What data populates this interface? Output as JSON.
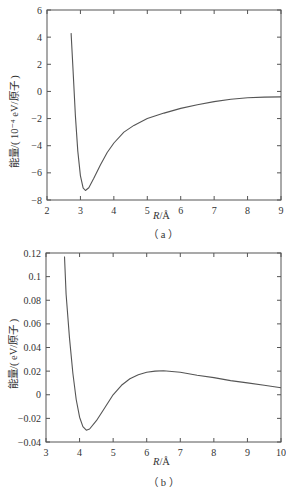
{
  "chart_data": [
    {
      "type": "line",
      "panel": "a",
      "caption": "（a）",
      "xlabel_var": "R",
      "xlabel_unit": "/Å",
      "ylabel": "能量/(10⁻⁴ eV/原子)",
      "xlim": [
        2,
        9
      ],
      "ylim": [
        -8,
        6
      ],
      "xticks": [
        2,
        3,
        4,
        5,
        6,
        7,
        8,
        9
      ],
      "yticks": [
        -8,
        -6,
        -4,
        -2,
        0,
        2,
        4,
        6
      ],
      "grid": false,
      "legend": null,
      "series": [
        {
          "name": "energy",
          "x": [
            2.72,
            2.78,
            2.85,
            2.92,
            3.0,
            3.08,
            3.15,
            3.25,
            3.4,
            3.6,
            3.8,
            4.0,
            4.3,
            4.6,
            5.0,
            5.5,
            6.0,
            6.5,
            7.0,
            7.5,
            8.0,
            8.5,
            9.0
          ],
          "y": [
            4.3,
            1.5,
            -1.8,
            -4.4,
            -6.2,
            -7.1,
            -7.3,
            -7.1,
            -6.4,
            -5.4,
            -4.5,
            -3.8,
            -3.0,
            -2.5,
            -2.0,
            -1.6,
            -1.25,
            -0.98,
            -0.75,
            -0.58,
            -0.47,
            -0.42,
            -0.4
          ]
        }
      ]
    },
    {
      "type": "line",
      "panel": "b",
      "caption": "（b）",
      "xlabel_var": "R",
      "xlabel_unit": "/Å",
      "ylabel": "能量/(eV/原子)",
      "xlim": [
        3,
        10
      ],
      "ylim": [
        -0.04,
        0.12
      ],
      "xticks": [
        3,
        4,
        5,
        6,
        7,
        8,
        9,
        10
      ],
      "yticks": [
        -0.04,
        -0.02,
        0,
        0.02,
        0.04,
        0.06,
        0.08,
        0.1,
        0.12
      ],
      "grid": false,
      "legend": null,
      "series": [
        {
          "name": "energy",
          "x": [
            3.55,
            3.6,
            3.7,
            3.8,
            3.9,
            4.0,
            4.1,
            4.2,
            4.3,
            4.5,
            4.75,
            5.0,
            5.25,
            5.5,
            5.75,
            6.0,
            6.25,
            6.5,
            7.0,
            7.5,
            8.0,
            8.5,
            9.0,
            9.5,
            10.0
          ],
          "y": [
            0.117,
            0.085,
            0.048,
            0.018,
            -0.004,
            -0.019,
            -0.027,
            -0.03,
            -0.029,
            -0.022,
            -0.011,
            0.0,
            0.008,
            0.0135,
            0.017,
            0.019,
            0.02,
            0.0203,
            0.019,
            0.0165,
            0.0145,
            0.012,
            0.01,
            0.008,
            0.006
          ]
        }
      ]
    }
  ],
  "figure": {
    "panels": [
      {
        "id": "a",
        "ylabel": "能量/( 10⁻⁴ eV/原子 )",
        "xlabel": "R/Å",
        "caption": "（a）",
        "xtick_labels": [
          "2",
          "3",
          "4",
          "5",
          "6",
          "7",
          "8",
          "9"
        ],
        "ytick_labels": [
          "6",
          "4",
          "2",
          "0",
          "-2",
          "-4",
          "-6",
          "-8"
        ]
      },
      {
        "id": "b",
        "ylabel": "能量/( eV/原子 )",
        "xlabel": "R/Å",
        "caption": "（b）",
        "xtick_labels": [
          "3",
          "4",
          "5",
          "6",
          "7",
          "8",
          "9",
          "10"
        ],
        "ytick_labels": [
          "0.12",
          "0.1",
          "0.08",
          "0.06",
          "0.04",
          "0.02",
          "0",
          "-0.02",
          "-0.04"
        ]
      }
    ],
    "labels": {
      "a_ylabel": "能量/( 10⁻⁴ eV/原子 )",
      "b_ylabel": "能量/( eV/原子 )",
      "xvar": "R",
      "xunit": "/Å",
      "a_caption": "（ a ）",
      "b_caption": "（ b ）"
    }
  }
}
